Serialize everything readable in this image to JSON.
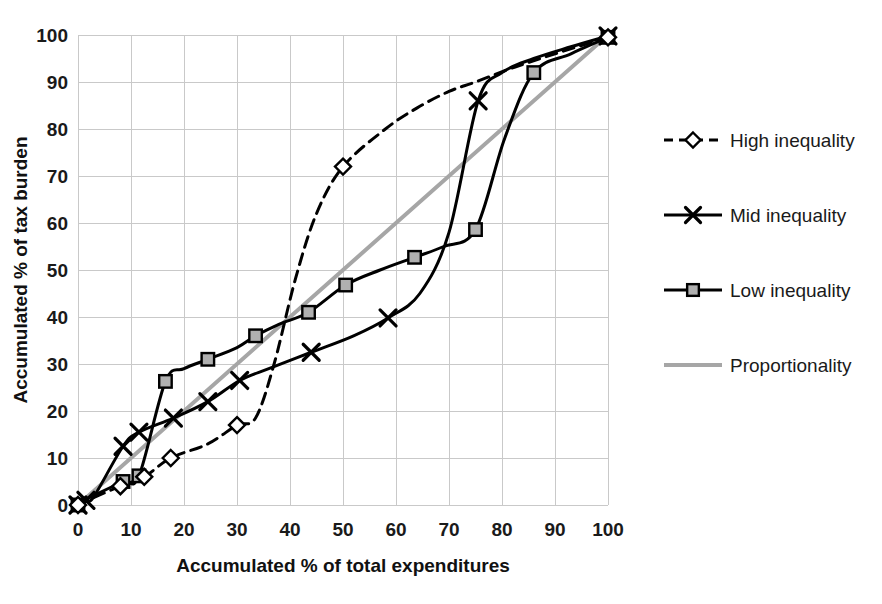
{
  "chart_data": {
    "type": "line",
    "title": "",
    "subtitle": "",
    "xlabel": "Accumulated % of total expenditures",
    "ylabel": "Accumulated % of tax burden",
    "xlim": [
      0,
      100
    ],
    "ylim": [
      0,
      100
    ],
    "xticks": [
      0,
      10,
      20,
      30,
      40,
      50,
      60,
      70,
      80,
      90,
      100
    ],
    "yticks": [
      0,
      10,
      20,
      30,
      40,
      50,
      60,
      70,
      80,
      90,
      100
    ],
    "xtick_labels": [
      "0",
      "10",
      "20",
      "30",
      "40",
      "50",
      "60",
      "70",
      "80",
      "90",
      "100"
    ],
    "ytick_labels": [
      "0",
      "10",
      "20",
      "30",
      "40",
      "50",
      "60",
      "70",
      "80",
      "90",
      "100"
    ],
    "grid": true,
    "grid_color": "#c9c9c9",
    "legend_position": "right",
    "background": "#ffffff",
    "series": [
      {
        "name": "High inequality",
        "marker": "diamond",
        "marker_fill": "#ffffff",
        "marker_stroke": "#000000",
        "line_style": "dashed",
        "color": "#000000",
        "width": 3,
        "points": [
          [
            0.0,
            0.0
          ],
          [
            1.5,
            0.7
          ],
          [
            3.0,
            1.6
          ],
          [
            8.0,
            4.0
          ],
          [
            12.5,
            6.0
          ],
          [
            17.5,
            10.0
          ],
          [
            24.5,
            13.0
          ],
          [
            30.0,
            17.0
          ],
          [
            33.5,
            18.5
          ],
          [
            37.0,
            30.0
          ],
          [
            41.0,
            48.0
          ],
          [
            45.0,
            62.0
          ],
          [
            50.0,
            72.0
          ],
          [
            58.0,
            80.0
          ],
          [
            64.0,
            84.5
          ],
          [
            70.0,
            88.0
          ],
          [
            75.0,
            90.0
          ],
          [
            82.0,
            93.0
          ],
          [
            90.0,
            96.0
          ],
          [
            100.0,
            99.5
          ]
        ],
        "marked_points": [
          [
            0.0,
            0.0
          ],
          [
            8.0,
            4.0
          ],
          [
            12.5,
            6.0
          ],
          [
            17.5,
            10.0
          ],
          [
            30.0,
            17.0
          ],
          [
            50.0,
            72.0
          ],
          [
            100.0,
            99.5
          ]
        ]
      },
      {
        "name": "Mid inequality",
        "marker": "x",
        "marker_fill": "none",
        "marker_stroke": "#000000",
        "line_style": "solid",
        "color": "#000000",
        "width": 3,
        "points": [
          [
            0.0,
            0.0
          ],
          [
            1.5,
            1.0
          ],
          [
            3.0,
            1.8
          ],
          [
            8.5,
            12.5
          ],
          [
            11.5,
            15.5
          ],
          [
            18.0,
            18.5
          ],
          [
            24.5,
            22.0
          ],
          [
            30.5,
            26.5
          ],
          [
            36.0,
            29.0
          ],
          [
            44.0,
            32.5
          ],
          [
            52.0,
            36.0
          ],
          [
            58.5,
            39.8
          ],
          [
            64.5,
            45.0
          ],
          [
            70.0,
            58.0
          ],
          [
            75.5,
            86.0
          ],
          [
            80.0,
            92.0
          ],
          [
            86.0,
            95.0
          ],
          [
            93.0,
            97.5
          ],
          [
            100.0,
            99.8
          ]
        ],
        "marked_points": [
          [
            0.0,
            0.0
          ],
          [
            1.5,
            1.0
          ],
          [
            8.5,
            12.5
          ],
          [
            11.5,
            15.5
          ],
          [
            18.0,
            18.5
          ],
          [
            24.5,
            22.0
          ],
          [
            30.5,
            26.5
          ],
          [
            44.0,
            32.5
          ],
          [
            58.5,
            39.8
          ],
          [
            75.5,
            86.0
          ],
          [
            100.0,
            99.8
          ]
        ]
      },
      {
        "name": "Low inequality",
        "marker": "square",
        "marker_fill": "#b0b0b0",
        "marker_stroke": "#000000",
        "line_style": "solid",
        "color": "#000000",
        "width": 3,
        "points": [
          [
            0.0,
            0.0
          ],
          [
            1.5,
            1.2
          ],
          [
            3.0,
            2.0
          ],
          [
            8.5,
            5.0
          ],
          [
            11.5,
            6.2
          ],
          [
            16.5,
            26.3
          ],
          [
            20.0,
            29.0
          ],
          [
            24.5,
            31.0
          ],
          [
            30.0,
            33.5
          ],
          [
            33.5,
            36.0
          ],
          [
            38.0,
            38.5
          ],
          [
            43.5,
            41.0
          ],
          [
            50.5,
            46.8
          ],
          [
            57.0,
            50.0
          ],
          [
            63.5,
            52.7
          ],
          [
            69.0,
            55.0
          ],
          [
            75.0,
            58.6
          ],
          [
            80.5,
            78.0
          ],
          [
            86.0,
            92.0
          ],
          [
            93.0,
            96.0
          ],
          [
            100.0,
            99.5
          ]
        ],
        "marked_points": [
          [
            0.0,
            0.0
          ],
          [
            8.5,
            5.0
          ],
          [
            11.5,
            6.2
          ],
          [
            16.5,
            26.3
          ],
          [
            24.5,
            31.0
          ],
          [
            33.5,
            36.0
          ],
          [
            43.5,
            41.0
          ],
          [
            50.5,
            46.8
          ],
          [
            63.5,
            52.7
          ],
          [
            75.0,
            58.6
          ],
          [
            86.0,
            92.0
          ],
          [
            100.0,
            99.5
          ]
        ]
      },
      {
        "name": "Proportionality",
        "marker": "none",
        "marker_fill": "none",
        "marker_stroke": "none",
        "line_style": "solid",
        "color": "#a6a6a6",
        "width": 4,
        "points": [
          [
            0.0,
            0.0
          ],
          [
            100.0,
            100.0
          ]
        ],
        "marked_points": []
      }
    ]
  },
  "legend": {
    "items": [
      {
        "label": "High inequality"
      },
      {
        "label": "Mid inequality"
      },
      {
        "label": "Low inequality"
      },
      {
        "label": "Proportionality"
      }
    ]
  },
  "axes": {
    "x_title": "Accumulated % of total expenditures",
    "y_title": "Accumulated % of tax burden"
  }
}
